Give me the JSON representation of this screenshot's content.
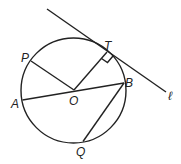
{
  "diagram": {
    "type": "geometry",
    "labels": {
      "P": "P",
      "T": "T",
      "B": "B",
      "A": "A",
      "O": "O",
      "Q": "Q",
      "l": "ℓ"
    },
    "right_angle_at": "T",
    "color": "#222222"
  }
}
